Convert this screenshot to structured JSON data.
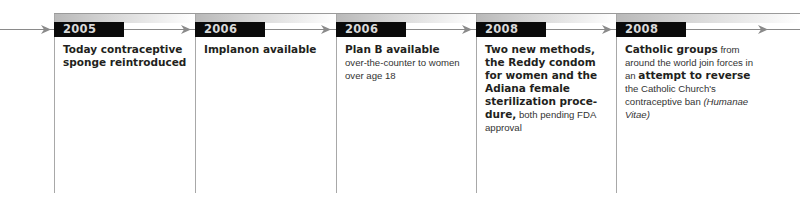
{
  "colors": {
    "year_box_bg": "#0a0a0a",
    "year_text": "#d9d9d9",
    "rule": "#9a9a9a",
    "text": "#231f20"
  },
  "timeline": {
    "events": [
      {
        "year": "2005",
        "headline_pre": "Today contraceptive sponge ",
        "headline_bold": "reintroduced",
        "detail": ""
      },
      {
        "year": "2006",
        "headline_pre": "Implanon ",
        "headline_bold": "available",
        "detail": ""
      },
      {
        "year": "2006",
        "headline_pre": "Plan B ",
        "headline_bold": "available",
        "detail": "over-the-counter to women over age 18"
      },
      {
        "year": "2008",
        "headline_bold": "Two new methods,",
        "headline_pre": " the Reddy condom for women and the Adiana female sterilization proce-dure,",
        "detail": " both pending FDA approval"
      },
      {
        "year": "2008",
        "headline_bold": "Catholic groups",
        "detail_1": " from around the world join forces in an ",
        "headline_bold_2": "attempt to reverse",
        "detail_2": " the Catholic Church's contraceptive ban ",
        "detail_italic": "(Humanae Vitae)"
      }
    ]
  }
}
